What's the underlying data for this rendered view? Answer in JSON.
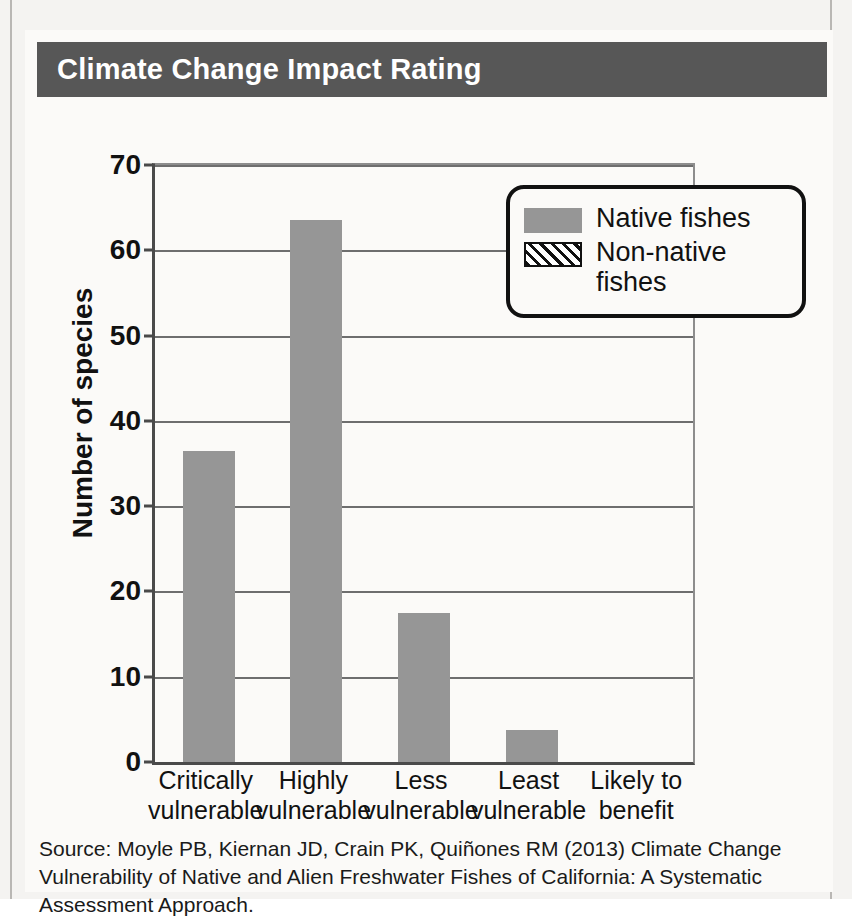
{
  "card": {
    "title": "Climate Change Impact Rating",
    "title_band_color": "#575757",
    "source": "Source: Moyle PB, Kiernan JD, Crain PK, Quiñones RM (2013) Climate Change Vulnerability of Native and Alien Freshwater Fishes of California: A Systematic Assessment Approach."
  },
  "chart_data": {
    "type": "bar",
    "title": "Climate Change Impact Rating",
    "xlabel": "",
    "ylabel": "Number of species",
    "ylim": [
      0,
      70
    ],
    "yticks": [
      0,
      10,
      20,
      30,
      40,
      50,
      60,
      70
    ],
    "grid": true,
    "legend_position": "upper-right",
    "categories": [
      "Critically vulnerable",
      "Highly vulnerable",
      "Less vulnerable",
      "Least vulnerable",
      "Likely to benefit"
    ],
    "category_lines": [
      [
        "Critically",
        "vulnerable"
      ],
      [
        "Highly",
        "vulnerable"
      ],
      [
        "Less",
        "vulnerable"
      ],
      [
        "Least",
        "vulnerable"
      ],
      [
        "Likely to",
        "benefit"
      ]
    ],
    "series": [
      {
        "name": "Native fishes",
        "style": "solid",
        "color": "#969696",
        "values": [
          36.5,
          63.5,
          17.5,
          3.7,
          0
        ]
      },
      {
        "name": "Non-native fishes",
        "style": "hatched",
        "color": "#111111",
        "values": [
          0,
          0,
          0,
          0,
          0
        ]
      }
    ]
  },
  "legend": {
    "items": [
      {
        "label": "Native fishes",
        "style": "solid"
      },
      {
        "label": "Non-native fishes",
        "style": "hatched"
      }
    ]
  }
}
